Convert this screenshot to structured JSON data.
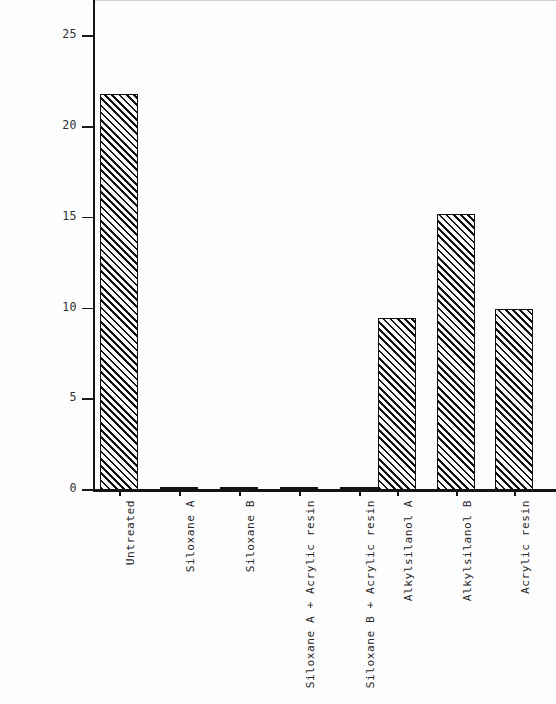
{
  "chart_data": {
    "type": "bar",
    "title": "",
    "xlabel": "",
    "ylabel": "Invasion of chloride ion (mm)",
    "ylim": [
      0,
      27
    ],
    "yticks": [
      0,
      5,
      10,
      15,
      20,
      25
    ],
    "ytick_labels": [
      "0",
      "5",
      "10",
      "15",
      "20",
      "25"
    ],
    "grid": false,
    "legend": "none",
    "categories": [
      "Untreated",
      "Siloxane A",
      "Siloxane B",
      "Siloxane A + Acrylic resin",
      "Siloxane B + Acrylic resin",
      "Alkylsilanol A",
      "Alkylsilanol B",
      "Acrylic resin"
    ],
    "values": [
      21.8,
      0.1,
      0.1,
      0.1,
      0.1,
      9.5,
      15.2,
      10.0
    ],
    "bar_style": {
      "fill": "diagonal-hatch",
      "hatch_color": "#111111",
      "edge_color": "#121212",
      "background": "#fafafa"
    }
  },
  "axis": {
    "y_label": "Invasion of chloride ion (mm)",
    "y_tick_labels": [
      "25",
      "20",
      "15",
      "10",
      "5",
      "0"
    ]
  }
}
